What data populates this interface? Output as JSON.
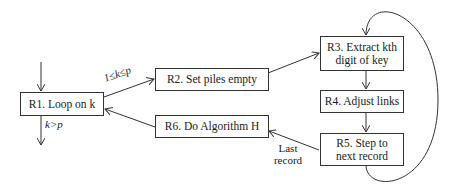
{
  "nodes": {
    "r1": {
      "id": "R1",
      "label": "R1. Loop on k"
    },
    "r2": {
      "id": "R2",
      "label": "R2. Set piles empty"
    },
    "r3": {
      "id": "R3",
      "label_line1": "R3. Extract kth",
      "label_line2": "digit of key"
    },
    "r4": {
      "id": "R4",
      "label": "R4. Adjust links"
    },
    "r5": {
      "id": "R5",
      "label_line1": "R5. Step to",
      "label_line2": "next record"
    },
    "r6": {
      "id": "R6",
      "label": "R6. Do Algorithm H"
    }
  },
  "edges": [
    {
      "from": "start",
      "to": "R1",
      "label": ""
    },
    {
      "from": "R1",
      "to": "R2",
      "label": "1≤k≤p"
    },
    {
      "from": "R1",
      "to": "end",
      "label": "k>p"
    },
    {
      "from": "R2",
      "to": "R3",
      "label": ""
    },
    {
      "from": "R3",
      "to": "R4",
      "label": ""
    },
    {
      "from": "R4",
      "to": "R5",
      "label": ""
    },
    {
      "from": "R5",
      "to": "R3",
      "label": ""
    },
    {
      "from": "R5",
      "to": "R6",
      "label_line1": "Last",
      "label_line2": "record"
    },
    {
      "from": "R6",
      "to": "R1",
      "label": ""
    }
  ],
  "labels": {
    "cond_loop": "1≤k≤p",
    "cond_exit": "k>p",
    "last_1": "Last",
    "last_2": "record"
  }
}
